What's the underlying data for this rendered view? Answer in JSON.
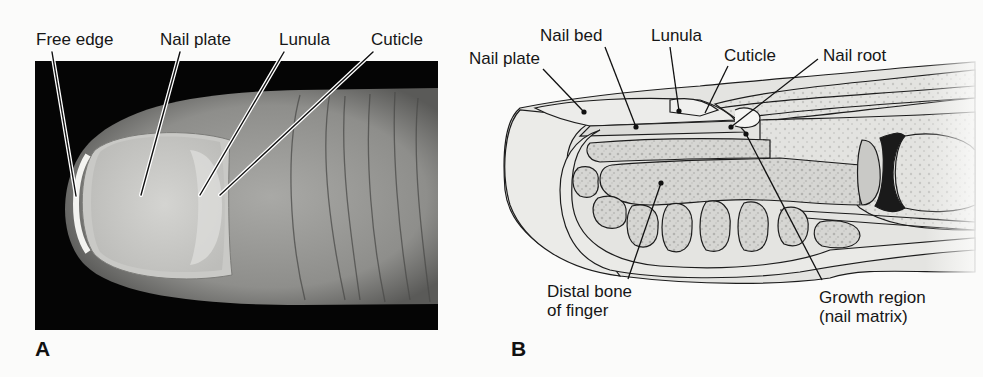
{
  "figure": {
    "panel_a": {
      "letter": "A",
      "description": "Photograph of fingertip showing nail",
      "labels": [
        {
          "id": "free-edge",
          "text": "Free edge"
        },
        {
          "id": "nail-plate",
          "text": "Nail plate"
        },
        {
          "id": "lunula",
          "text": "Lunula"
        },
        {
          "id": "cuticle",
          "text": "Cuticle"
        }
      ]
    },
    "panel_b": {
      "letter": "B",
      "description": "Sagittal section illustration of fingertip and nail",
      "labels": [
        {
          "id": "nail-plate",
          "text": "Nail plate"
        },
        {
          "id": "nail-bed",
          "text": "Nail bed"
        },
        {
          "id": "lunula",
          "text": "Lunula"
        },
        {
          "id": "cuticle",
          "text": "Cuticle"
        },
        {
          "id": "nail-root",
          "text": "Nail root"
        },
        {
          "id": "distal-bone",
          "text_line1": "Distal bone",
          "text_line2": "of finger"
        },
        {
          "id": "growth-region",
          "text_line1": "Growth region",
          "text_line2": "(nail matrix)"
        }
      ]
    },
    "colors": {
      "background": "#fbfbfa",
      "photo_black": "#050505",
      "skin_gray": "#9a9a98",
      "nail_light": "#cfcfcc",
      "diagram_fill": "#e2e2df",
      "bone_fill": "#d2d2cf",
      "joint_dark": "#1a1a1a",
      "line": "#1c1c1c"
    }
  }
}
